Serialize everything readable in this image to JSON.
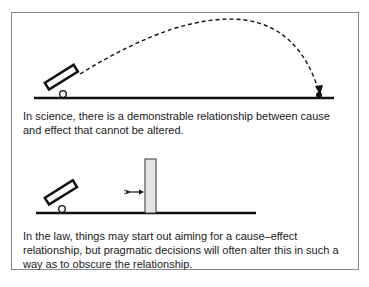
{
  "panels": [
    {
      "caption": "In science, there is a demonstrable relationship between cause and effect that cannot be altered.",
      "elements": [
        "cannon",
        "dashed-trajectory",
        "ground-line",
        "target-ball"
      ]
    },
    {
      "caption": "In the law, things may start out aiming for a cause–effect relationship, but pragmatic decisions will often alter this in such a way as to obscure the relationship.",
      "elements": [
        "cannon",
        "arrow",
        "wall",
        "ground-line"
      ]
    }
  ],
  "colors": {
    "line": "#111111",
    "wall_fill": "#e6e6e6",
    "border": "#8a8a8a"
  }
}
